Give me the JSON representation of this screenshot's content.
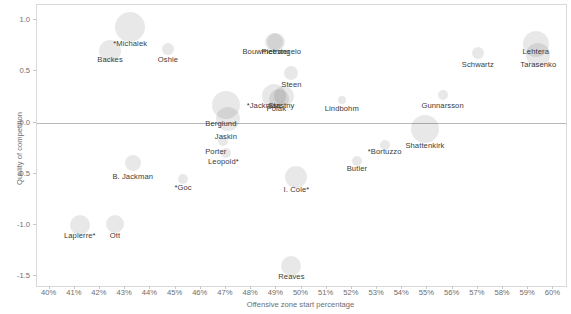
{
  "chart_data": {
    "type": "scatter",
    "title": "",
    "xlabel": "Offensive zone start percentage",
    "ylabel": "Quality of competition",
    "xlim": [
      39.5,
      60.5
    ],
    "ylim": [
      -1.6,
      1.15
    ],
    "xticks": [
      "40%",
      "41%",
      "42%",
      "43%",
      "44%",
      "45%",
      "46%",
      "47%",
      "48%",
      "49%",
      "50%",
      "51%",
      "52%",
      "53%",
      "54%",
      "55%",
      "56%",
      "57%",
      "58%",
      "59%",
      "60%"
    ],
    "xtick_values": [
      40,
      41,
      42,
      43,
      44,
      45,
      46,
      47,
      48,
      49,
      50,
      51,
      52,
      53,
      54,
      55,
      56,
      57,
      58,
      59,
      60
    ],
    "yticks": [
      "1.0",
      "0.5",
      "0.0",
      "-0.5",
      "-1.0",
      "-1.5"
    ],
    "ytick_values": [
      1.0,
      0.5,
      0.0,
      -0.5,
      -1.0,
      -1.5
    ],
    "grid": false,
    "legend": "none",
    "reference_lines": [
      {
        "axis": "y",
        "value": 0.0,
        "color": "#b8b8b8"
      }
    ],
    "bubble_color": "#000000",
    "bubble_opacity": 0.09,
    "label_color": "#3a3a3a",
    "points": [
      {
        "label": "*Michalek",
        "x": 43.2,
        "y": 0.93,
        "size": 15,
        "lx": 43.2,
        "ly": 0.78
      },
      {
        "label": "Backes",
        "x": 42.4,
        "y": 0.7,
        "size": 11,
        "lx": 42.4,
        "ly": 0.62
      },
      {
        "label": "Oshie",
        "x": 44.7,
        "y": 0.72,
        "size": 6,
        "lx": 44.7,
        "ly": 0.62
      },
      {
        "label": "Bouwmeester",
        "x": 48.9,
        "y": 0.79,
        "size": 9,
        "lx": 48.6,
        "ly": 0.7
      },
      {
        "label": "Pietrangelo",
        "x": 49.0,
        "y": 0.79,
        "size": 9,
        "lx": 49.2,
        "ly": 0.7
      },
      {
        "label": "Steen",
        "x": 49.6,
        "y": 0.48,
        "size": 7,
        "lx": 49.6,
        "ly": 0.38
      },
      {
        "label": "*Jackman",
        "x": 48.9,
        "y": 0.26,
        "size": 12,
        "lx": 48.5,
        "ly": 0.17
      },
      {
        "label": "Stastny",
        "x": 49.3,
        "y": 0.26,
        "size": 10,
        "lx": 49.2,
        "ly": 0.17
      },
      {
        "label": "Polak",
        "x": 49.1,
        "y": 0.23,
        "size": 10,
        "lx": 49.0,
        "ly": 0.14
      },
      {
        "label": "Lindbohm",
        "x": 51.6,
        "y": 0.22,
        "size": 4,
        "lx": 51.6,
        "ly": 0.14
      },
      {
        "label": "Berglund",
        "x": 47.0,
        "y": 0.17,
        "size": 14,
        "lx": 46.8,
        "ly": 0.0
      },
      {
        "label": "Jaskin",
        "x": 47.1,
        "y": 0.03,
        "size": 12,
        "lx": 47.0,
        "ly": -0.13
      },
      {
        "label": "Porter",
        "x": 46.9,
        "y": -0.18,
        "size": 5,
        "lx": 46.6,
        "ly": -0.28
      },
      {
        "label": "Leopold*",
        "x": 47.0,
        "y": -0.3,
        "size": 5,
        "lx": 46.9,
        "ly": -0.38
      },
      {
        "label": "Butler",
        "x": 52.2,
        "y": -0.38,
        "size": 5,
        "lx": 52.2,
        "ly": -0.45
      },
      {
        "label": "*Bortuzzo",
        "x": 53.3,
        "y": -0.22,
        "size": 5,
        "lx": 53.3,
        "ly": -0.28
      },
      {
        "label": "Shattenkirk",
        "x": 54.9,
        "y": -0.06,
        "size": 14,
        "lx": 54.9,
        "ly": -0.22
      },
      {
        "label": "Schwartz",
        "x": 57.0,
        "y": 0.68,
        "size": 6,
        "lx": 57.0,
        "ly": 0.57
      },
      {
        "label": "Lehtera",
        "x": 59.3,
        "y": 0.77,
        "size": 13,
        "lx": 59.3,
        "ly": 0.7
      },
      {
        "label": "Tarasenko",
        "x": 59.4,
        "y": 0.66,
        "size": 12,
        "lx": 59.4,
        "ly": 0.57
      },
      {
        "label": "Gunnarsson",
        "x": 55.6,
        "y": 0.27,
        "size": 5,
        "lx": 55.6,
        "ly": 0.17
      },
      {
        "label": "B. Jackman",
        "x": 43.3,
        "y": -0.4,
        "size": 8,
        "lx": 43.3,
        "ly": -0.52
      },
      {
        "label": "*Goc",
        "x": 45.3,
        "y": -0.55,
        "size": 5,
        "lx": 45.3,
        "ly": -0.63
      },
      {
        "label": "I. Cole*",
        "x": 49.8,
        "y": -0.53,
        "size": 11,
        "lx": 49.8,
        "ly": -0.65
      },
      {
        "label": "Lapierre*",
        "x": 41.2,
        "y": -1.0,
        "size": 10,
        "lx": 41.2,
        "ly": -1.1
      },
      {
        "label": "Ott",
        "x": 42.6,
        "y": -0.99,
        "size": 9,
        "lx": 42.6,
        "ly": -1.1
      },
      {
        "label": "Reaves",
        "x": 49.6,
        "y": -1.4,
        "size": 10,
        "lx": 49.6,
        "ly": -1.5
      }
    ]
  }
}
